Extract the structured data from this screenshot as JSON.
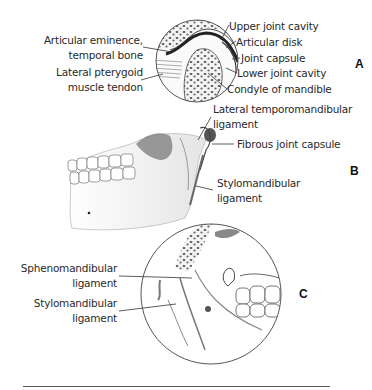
{
  "figure": {
    "panels": [
      {
        "id": "A",
        "letter": "A",
        "labels_left": [
          {
            "line1": "Articular eminence,",
            "line2": "temporal bone"
          },
          {
            "line1": "Lateral pterygoid",
            "line2": "muscle tendon"
          }
        ],
        "labels_right": [
          "Upper joint cavity",
          "Articular disk",
          "Joint capsule",
          "Lower joint cavity",
          "Condyle of mandible"
        ]
      },
      {
        "id": "B",
        "letter": "B",
        "labels": [
          {
            "line1": "Lateral temporomandibular",
            "line2": "ligament"
          },
          {
            "line1": "Fibrous joint capsule"
          },
          {
            "line1": "Stylomandibular",
            "line2": "ligament"
          }
        ]
      },
      {
        "id": "C",
        "letter": "C",
        "labels": [
          {
            "line1": "Sphenomandibular",
            "line2": "ligament"
          },
          {
            "line1": "Stylomandibular",
            "line2": "ligament"
          }
        ]
      }
    ],
    "colors": {
      "line": "#333333",
      "bone_shade": "#8a8a8a",
      "rule": "#555555"
    }
  }
}
